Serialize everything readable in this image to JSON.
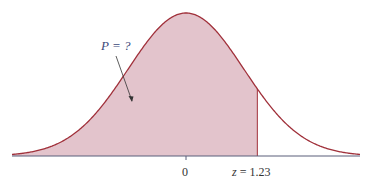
{
  "chart_data": {
    "type": "area",
    "title": "",
    "xlabel": "",
    "ylabel": "",
    "tick_labels": [
      "0",
      "z = 1.23"
    ],
    "z_value": 1.23,
    "shaded_region": "left of z = 1.23",
    "annotation": "P = ?",
    "colors": {
      "fill": "#e3c4cc",
      "curve": "#a0303a",
      "axis": "#5a5f7a"
    }
  },
  "labels": {
    "annotation": "P = ?",
    "zero": "0",
    "z": "z = 1.23"
  }
}
